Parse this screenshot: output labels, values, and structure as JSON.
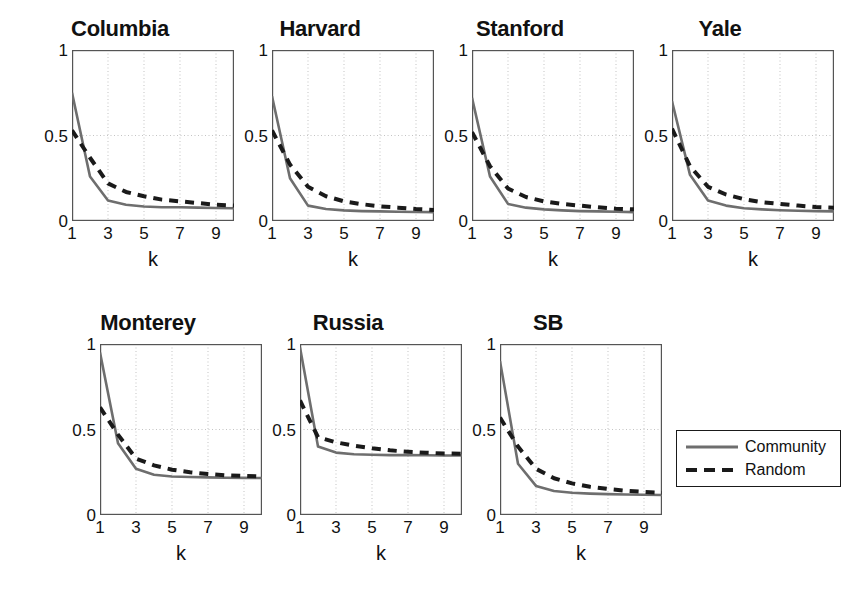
{
  "figure": {
    "xlabel": "k",
    "yticks": [
      "0",
      "0.5",
      "1"
    ],
    "xticks": [
      "1",
      "3",
      "5",
      "7",
      "9"
    ],
    "colors": {
      "community": "#6e6e6e",
      "random": "#1a1a1a",
      "axis": "#555555",
      "grid": "#aaaaaa"
    }
  },
  "legend": {
    "community_label": "Community",
    "random_label": "Random"
  },
  "chart_data": [
    {
      "type": "line",
      "title": "Columbia",
      "xlabel": "k",
      "ylabel": "",
      "xlim": [
        1,
        10
      ],
      "ylim": [
        0,
        1
      ],
      "grid": true,
      "x": [
        1,
        2,
        3,
        4,
        5,
        6,
        7,
        8,
        9,
        10
      ],
      "series": [
        {
          "name": "Community",
          "values": [
            0.75,
            0.26,
            0.12,
            0.095,
            0.085,
            0.08,
            0.08,
            0.078,
            0.076,
            0.075
          ]
        },
        {
          "name": "Random",
          "values": [
            0.53,
            0.37,
            0.22,
            0.17,
            0.145,
            0.125,
            0.115,
            0.105,
            0.095,
            0.09
          ]
        }
      ]
    },
    {
      "type": "line",
      "title": "Harvard",
      "xlabel": "k",
      "ylabel": "",
      "xlim": [
        1,
        10
      ],
      "ylim": [
        0,
        1
      ],
      "grid": true,
      "x": [
        1,
        2,
        3,
        4,
        5,
        6,
        7,
        8,
        9,
        10
      ],
      "series": [
        {
          "name": "Community",
          "values": [
            0.73,
            0.25,
            0.09,
            0.07,
            0.062,
            0.058,
            0.056,
            0.054,
            0.053,
            0.052
          ]
        },
        {
          "name": "Random",
          "values": [
            0.53,
            0.33,
            0.2,
            0.145,
            0.115,
            0.098,
            0.086,
            0.078,
            0.07,
            0.065
          ]
        }
      ]
    },
    {
      "type": "line",
      "title": "Stanford",
      "xlabel": "k",
      "ylabel": "",
      "xlim": [
        1,
        10
      ],
      "ylim": [
        0,
        1
      ],
      "grid": true,
      "x": [
        1,
        2,
        3,
        4,
        5,
        6,
        7,
        8,
        9,
        10
      ],
      "series": [
        {
          "name": "Community",
          "values": [
            0.72,
            0.26,
            0.1,
            0.078,
            0.068,
            0.062,
            0.058,
            0.056,
            0.054,
            0.052
          ]
        },
        {
          "name": "Random",
          "values": [
            0.52,
            0.32,
            0.19,
            0.14,
            0.115,
            0.1,
            0.09,
            0.08,
            0.072,
            0.068
          ]
        }
      ]
    },
    {
      "type": "line",
      "title": "Yale",
      "xlabel": "k",
      "ylabel": "",
      "xlim": [
        1,
        10
      ],
      "ylim": [
        0,
        1
      ],
      "grid": true,
      "x": [
        1,
        2,
        3,
        4,
        5,
        6,
        7,
        8,
        9,
        10
      ],
      "series": [
        {
          "name": "Community",
          "values": [
            0.7,
            0.27,
            0.12,
            0.09,
            0.075,
            0.068,
            0.063,
            0.06,
            0.058,
            0.056
          ]
        },
        {
          "name": "Random",
          "values": [
            0.54,
            0.32,
            0.2,
            0.155,
            0.128,
            0.11,
            0.1,
            0.09,
            0.082,
            0.078
          ]
        }
      ]
    },
    {
      "type": "line",
      "title": "Monterey",
      "xlabel": "k",
      "ylabel": "",
      "xlim": [
        1,
        10
      ],
      "ylim": [
        0,
        1
      ],
      "grid": true,
      "x": [
        1,
        2,
        3,
        4,
        5,
        6,
        7,
        8,
        9,
        10
      ],
      "series": [
        {
          "name": "Community",
          "values": [
            0.95,
            0.42,
            0.27,
            0.235,
            0.225,
            0.222,
            0.22,
            0.218,
            0.217,
            0.216
          ]
        },
        {
          "name": "Random",
          "values": [
            0.63,
            0.47,
            0.33,
            0.29,
            0.265,
            0.25,
            0.24,
            0.232,
            0.228,
            0.225
          ]
        }
      ]
    },
    {
      "type": "line",
      "title": "Russia",
      "xlabel": "k",
      "ylabel": "",
      "xlim": [
        1,
        10
      ],
      "ylim": [
        0,
        1
      ],
      "grid": true,
      "x": [
        1,
        2,
        3,
        4,
        5,
        6,
        7,
        8,
        9,
        10
      ],
      "series": [
        {
          "name": "Community",
          "values": [
            0.98,
            0.4,
            0.365,
            0.355,
            0.352,
            0.35,
            0.35,
            0.349,
            0.348,
            0.348
          ]
        },
        {
          "name": "Random",
          "values": [
            0.67,
            0.455,
            0.425,
            0.405,
            0.39,
            0.378,
            0.37,
            0.364,
            0.36,
            0.358
          ]
        }
      ]
    },
    {
      "type": "line",
      "title": "SB",
      "xlabel": "k",
      "ylabel": "",
      "xlim": [
        1,
        10
      ],
      "ylim": [
        0,
        1
      ],
      "grid": true,
      "x": [
        1,
        2,
        3,
        4,
        5,
        6,
        7,
        8,
        9,
        10
      ],
      "series": [
        {
          "name": "Community",
          "values": [
            0.9,
            0.3,
            0.17,
            0.14,
            0.13,
            0.125,
            0.122,
            0.12,
            0.118,
            0.117
          ]
        },
        {
          "name": "Random",
          "values": [
            0.57,
            0.4,
            0.27,
            0.215,
            0.185,
            0.165,
            0.152,
            0.142,
            0.135,
            0.13
          ]
        }
      ]
    }
  ]
}
